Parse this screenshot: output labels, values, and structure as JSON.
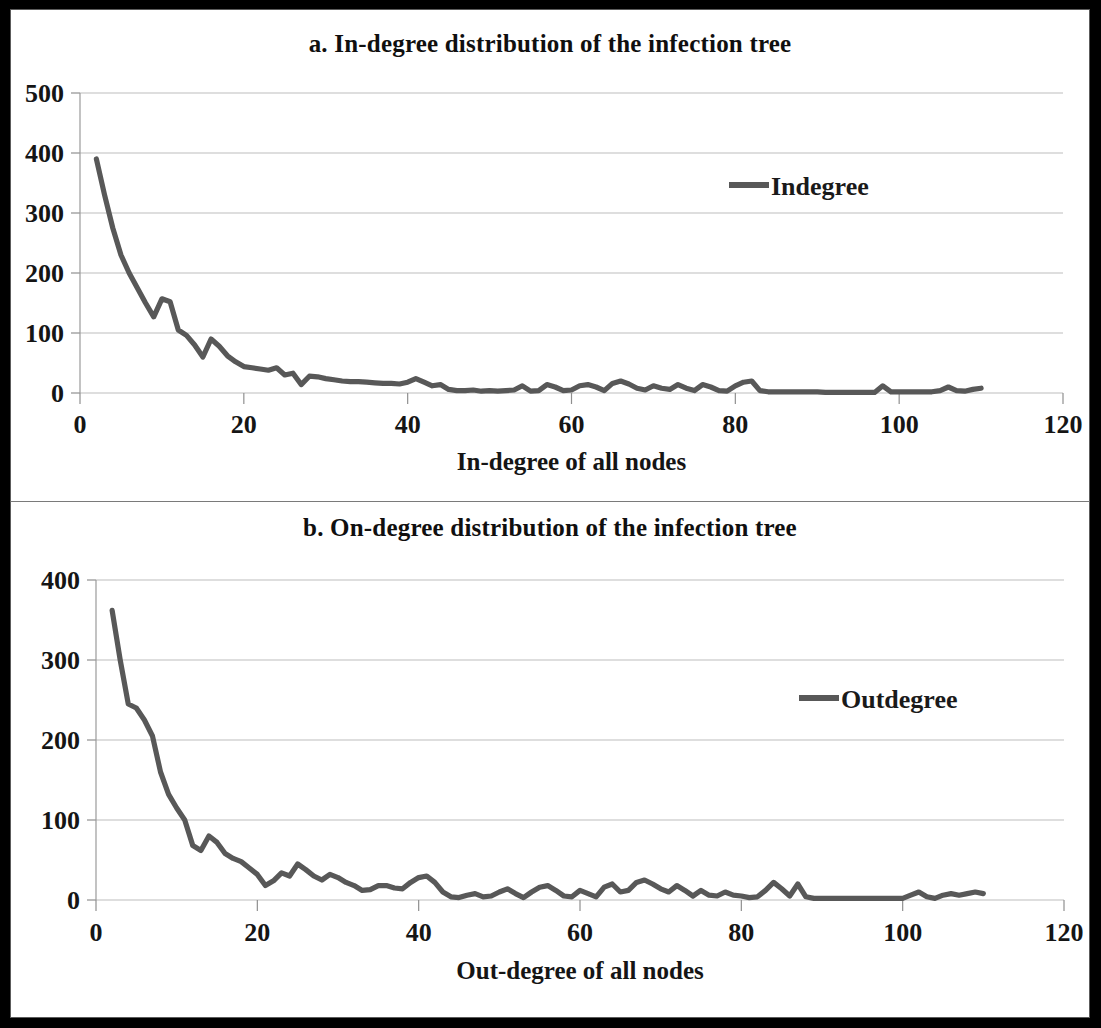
{
  "figure": {
    "background": "#ffffff",
    "border_color": "#000000",
    "series_color": "#585858",
    "grid_color": "#bdbdbd"
  },
  "panel_a": {
    "title": "a. In-degree distribution of the infection tree",
    "legend_label": "Indegree",
    "xlabel": "In-degree of all nodes",
    "ylabel": ""
  },
  "panel_b": {
    "title": "b. On-degree distribution of the infection tree",
    "legend_label": "Outdegree",
    "xlabel": "Out-degree of all nodes",
    "ylabel": ""
  },
  "chart_data": [
    {
      "id": "panel_a",
      "type": "line",
      "title": "a. In-degree distribution of the infection tree",
      "xlabel": "In-degree of all nodes",
      "ylabel": "",
      "legend": [
        "Indegree"
      ],
      "legend_position": "inside-top-right",
      "grid": "horizontal",
      "xlim": [
        0,
        120
      ],
      "ylim": [
        0,
        500
      ],
      "xticks": [
        0,
        20,
        40,
        60,
        80,
        100,
        120
      ],
      "yticks": [
        0,
        100,
        200,
        300,
        400,
        500
      ],
      "series": [
        {
          "name": "Indegree",
          "color": "#585858",
          "x": [
            2,
            3,
            4,
            5,
            6,
            7,
            8,
            9,
            10,
            11,
            12,
            13,
            14,
            15,
            16,
            17,
            18,
            19,
            20,
            21,
            22,
            23,
            24,
            25,
            26,
            27,
            28,
            29,
            30,
            31,
            32,
            33,
            34,
            35,
            36,
            37,
            38,
            39,
            40,
            41,
            42,
            43,
            44,
            45,
            46,
            47,
            48,
            49,
            50,
            51,
            52,
            53,
            54,
            55,
            56,
            57,
            58,
            59,
            60,
            61,
            62,
            63,
            64,
            65,
            66,
            67,
            68,
            69,
            70,
            71,
            72,
            73,
            74,
            75,
            76,
            77,
            78,
            79,
            80,
            81,
            82,
            83,
            84,
            85,
            86,
            87,
            88,
            89,
            90,
            91,
            92,
            93,
            94,
            95,
            96,
            97,
            98,
            99,
            100,
            101,
            102,
            103,
            104,
            105,
            106,
            107,
            108,
            109,
            110
          ],
          "values": [
            390,
            330,
            275,
            230,
            200,
            175,
            150,
            127,
            157,
            152,
            105,
            96,
            80,
            60,
            90,
            78,
            62,
            52,
            44,
            42,
            40,
            38,
            42,
            30,
            33,
            14,
            28,
            27,
            24,
            22,
            20,
            19,
            19,
            18,
            17,
            16,
            16,
            15,
            18,
            24,
            18,
            12,
            14,
            6,
            4,
            4,
            5,
            3,
            4,
            3,
            4,
            5,
            12,
            3,
            4,
            14,
            10,
            4,
            5,
            12,
            14,
            10,
            4,
            16,
            20,
            15,
            8,
            5,
            12,
            8,
            6,
            14,
            8,
            4,
            14,
            10,
            4,
            3,
            12,
            18,
            20,
            4,
            2,
            2,
            2,
            2,
            2,
            2,
            2,
            1,
            1,
            1,
            1,
            1,
            1,
            1,
            12,
            2,
            2,
            2,
            2,
            2,
            2,
            4,
            10,
            4,
            3,
            6,
            8
          ]
        }
      ]
    },
    {
      "id": "panel_b",
      "type": "line",
      "title": "b. On-degree distribution of the infection tree",
      "xlabel": "Out-degree of all nodes",
      "ylabel": "",
      "legend": [
        "Outdegree"
      ],
      "legend_position": "inside-top-right",
      "grid": "horizontal",
      "xlim": [
        0,
        120
      ],
      "ylim": [
        0,
        400
      ],
      "xticks": [
        0,
        20,
        40,
        60,
        80,
        100,
        120
      ],
      "yticks": [
        0,
        100,
        200,
        300,
        400
      ],
      "series": [
        {
          "name": "Outdegree",
          "color": "#585858",
          "x": [
            2,
            3,
            4,
            5,
            6,
            7,
            8,
            9,
            10,
            11,
            12,
            13,
            14,
            15,
            16,
            17,
            18,
            19,
            20,
            21,
            22,
            23,
            24,
            25,
            26,
            27,
            28,
            29,
            30,
            31,
            32,
            33,
            34,
            35,
            36,
            37,
            38,
            39,
            40,
            41,
            42,
            43,
            44,
            45,
            46,
            47,
            48,
            49,
            50,
            51,
            52,
            53,
            54,
            55,
            56,
            57,
            58,
            59,
            60,
            61,
            62,
            63,
            64,
            65,
            66,
            67,
            68,
            69,
            70,
            71,
            72,
            73,
            74,
            75,
            76,
            77,
            78,
            79,
            80,
            81,
            82,
            83,
            84,
            85,
            86,
            87,
            88,
            89,
            90,
            91,
            92,
            93,
            94,
            95,
            96,
            97,
            98,
            99,
            100,
            101,
            102,
            103,
            104,
            105,
            106,
            107,
            108,
            109,
            110
          ],
          "values": [
            362,
            300,
            245,
            240,
            225,
            205,
            160,
            132,
            115,
            100,
            68,
            62,
            80,
            72,
            58,
            52,
            48,
            40,
            32,
            18,
            24,
            34,
            30,
            45,
            38,
            30,
            25,
            32,
            28,
            22,
            18,
            12,
            13,
            18,
            18,
            15,
            14,
            22,
            28,
            30,
            22,
            10,
            4,
            3,
            6,
            8,
            4,
            5,
            10,
            14,
            8,
            3,
            10,
            16,
            18,
            12,
            5,
            4,
            12,
            8,
            4,
            16,
            20,
            10,
            12,
            22,
            25,
            20,
            14,
            10,
            18,
            12,
            5,
            12,
            6,
            5,
            10,
            6,
            5,
            3,
            4,
            12,
            22,
            14,
            5,
            20,
            4,
            2,
            2,
            2,
            2,
            2,
            2,
            2,
            2,
            2,
            2,
            2,
            2,
            6,
            10,
            4,
            2,
            6,
            8,
            6,
            8,
            10,
            8
          ]
        }
      ]
    }
  ]
}
